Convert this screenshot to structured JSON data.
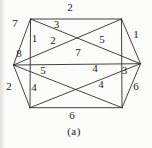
{
  "figure": {
    "type": "weighted-graph-diagram",
    "caption": "(a)",
    "background_color": "#fcfcfa",
    "line_color": "#2e2d2b",
    "text_color": "#1c1b19",
    "canvas": {
      "width": 152,
      "height": 148
    },
    "vertices": {
      "TL": {
        "x": 30.5,
        "y": 19
      },
      "TR": {
        "x": 121.5,
        "y": 19
      },
      "L": {
        "x": 13.5,
        "y": 65
      },
      "R": {
        "x": 140.5,
        "y": 63.7
      },
      "BL": {
        "x": 30,
        "y": 107.7
      },
      "BR": {
        "x": 122,
        "y": 107.7
      }
    },
    "edges": [
      {
        "id": "top",
        "from": "TL",
        "to": "TR"
      },
      {
        "id": "upper-right",
        "from": "TR",
        "to": "R"
      },
      {
        "id": "lower-right",
        "from": "R",
        "to": "BR"
      },
      {
        "id": "bottom",
        "from": "BL",
        "to": "BR"
      },
      {
        "id": "lower-left",
        "from": "L",
        "to": "BL"
      },
      {
        "id": "upper-left",
        "from": "L",
        "to": "TL"
      },
      {
        "id": "left-vertical",
        "from": "TL",
        "to": "BL"
      },
      {
        "id": "right-vertical",
        "from": "TR",
        "to": "BR"
      },
      {
        "id": "horizontal",
        "from": "L",
        "to": "R"
      },
      {
        "id": "diag-TL-R",
        "from": "TL",
        "to": "R"
      },
      {
        "id": "diag-L-TR",
        "from": "L",
        "to": "TR"
      },
      {
        "id": "diag-L-BR",
        "from": "L",
        "to": "BR"
      },
      {
        "id": "diag-BL-R",
        "from": "BL",
        "to": "R"
      }
    ],
    "edge_weight_labels": [
      {
        "value": "2",
        "x": 70,
        "y": 7,
        "near": "top"
      },
      {
        "value": "7",
        "x": 15,
        "y": 23,
        "near": "upper-left"
      },
      {
        "value": "8",
        "x": 19,
        "y": 53,
        "near": "upper-left"
      },
      {
        "value": "2",
        "x": 9,
        "y": 86,
        "near": "lower-left"
      },
      {
        "value": "1",
        "x": 34.5,
        "y": 38,
        "near": "left-vertical"
      },
      {
        "value": "3",
        "x": 56.5,
        "y": 24,
        "near": "diag-TL-R"
      },
      {
        "value": "2",
        "x": 53,
        "y": 40,
        "near": "diag-L-TR"
      },
      {
        "value": "5",
        "x": 102,
        "y": 38.5,
        "near": "diag-TL-R"
      },
      {
        "value": "7",
        "x": 78,
        "y": 52,
        "near": "horizontal"
      },
      {
        "value": "1",
        "x": 136,
        "y": 34,
        "near": "upper-right"
      },
      {
        "value": "3",
        "x": 124.5,
        "y": 70,
        "near": "right-vertical"
      },
      {
        "value": "5",
        "x": 43,
        "y": 69.5,
        "near": "horizontal"
      },
      {
        "value": "4",
        "x": 95,
        "y": 68,
        "near": "horizontal"
      },
      {
        "value": "4",
        "x": 34,
        "y": 87,
        "near": "left-vertical"
      },
      {
        "value": "4",
        "x": 101,
        "y": 84,
        "near": "diag-BL-R"
      },
      {
        "value": "6",
        "x": 136,
        "y": 86,
        "near": "lower-right"
      },
      {
        "value": "6",
        "x": 72,
        "y": 114.5,
        "near": "bottom"
      }
    ]
  }
}
